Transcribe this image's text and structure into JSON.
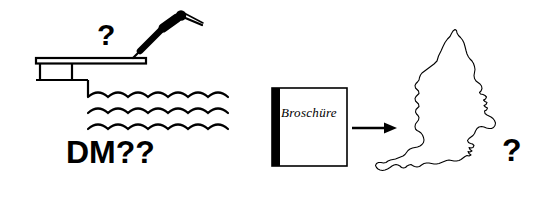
{
  "image": {
    "title": "Diving board and brochure-to-England diagram",
    "width": 549,
    "height": 207,
    "background_color": "#ffffff",
    "ink_color": "#000000"
  },
  "panels": {
    "left": {
      "name": "diving-board-scene",
      "price_label": "DM??",
      "question_mark": "?",
      "elements": [
        "diving-board",
        "diver-figure",
        "water-waves",
        "pool-edge"
      ],
      "wave_rows": 3
    },
    "right": {
      "name": "brochure-to-map-scene",
      "brochure_label": "Broschüre",
      "question_mark": "?",
      "arrow_direction": "right",
      "map_label": "England and Wales outline",
      "elements": [
        "brochure",
        "arrow-right",
        "england-map"
      ]
    }
  }
}
